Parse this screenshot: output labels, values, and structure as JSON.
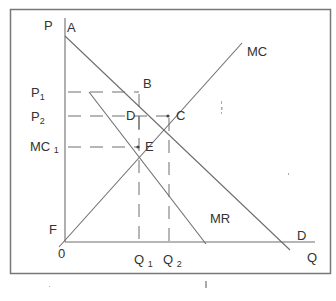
{
  "diagram": {
    "axes": {
      "y_label": "P",
      "x_label": "Q",
      "origin_label": "0"
    },
    "curves": {
      "demand": "D",
      "marginal_revenue": "MR",
      "marginal_cost": "MC"
    },
    "points": {
      "A": "A",
      "B": "B",
      "C": "C",
      "D": "D",
      "E": "E",
      "F": "F"
    },
    "price_levels": {
      "p1": {
        "main": "P",
        "sub": "1"
      },
      "p2": {
        "main": "P",
        "sub": "2"
      },
      "mc1": {
        "main": "MC ",
        "sub": "1"
      }
    },
    "quantity_levels": {
      "q1": {
        "main": "Q ",
        "sub": "1"
      },
      "q2": {
        "main": "Q ",
        "sub": "2"
      }
    }
  }
}
